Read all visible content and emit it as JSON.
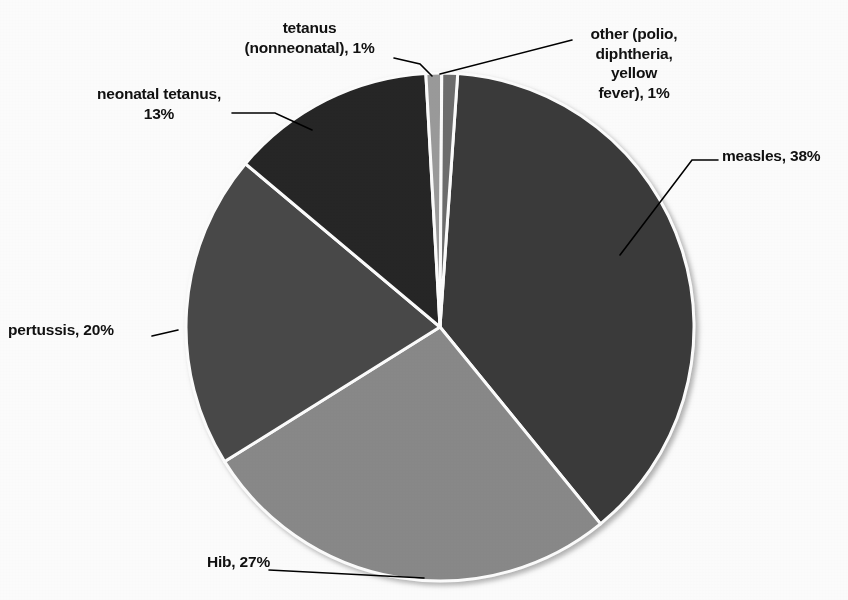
{
  "chart_data": {
    "type": "pie",
    "title": "",
    "subtitle": "",
    "xlabel": "",
    "ylabel": "",
    "legend_position": "none",
    "grid": false,
    "labels_inline": true,
    "units": "percent",
    "categories": [
      "measles",
      "Hib",
      "pertussis",
      "neonatal tetanus",
      "tetanus (nonneonatal)",
      "other (polio, diphtheria, yellow fever)"
    ],
    "values": [
      38,
      27,
      20,
      13,
      1,
      1
    ],
    "slices": [
      {
        "key": "measles",
        "name": "measles",
        "value": 38,
        "value_text": "38%",
        "label_text": "measles, 38%",
        "color": "#3a3a3a",
        "start_angle": 4,
        "end_angle": 140.8,
        "label_x": 722,
        "label_y": 146,
        "label_align": "lbl-right",
        "leader": "M 620 255 L 692 160 L 718 160"
      },
      {
        "key": "hib",
        "name": "Hib",
        "value": 27,
        "value_text": "27%",
        "label_text": "Hib, 27%",
        "color": "#8a8a8a",
        "start_angle": 140.8,
        "end_angle": 238,
        "label_x": 262,
        "label_y": 552,
        "label_align": "lbl-left",
        "leader": "M 269 570 L 424 578"
      },
      {
        "key": "pertussis",
        "name": "pertussis",
        "value": 20,
        "value_text": "20%",
        "label_text": "pertussis, 20%",
        "color": "#4a4a4a",
        "start_angle": 238,
        "end_angle": 310,
        "label_x": 12,
        "label_y": 322,
        "label_align": "lbl-right",
        "leader": "M 152 336 L 178 330"
      },
      {
        "key": "neonatal-tetanus",
        "name": "neonatal tetanus",
        "value": 13,
        "value_text": "13%",
        "label_text": "neonatal tetanus,\n13%",
        "color": "#262626",
        "start_angle": 310,
        "end_angle": 356.8,
        "label_x": 88,
        "label_y": 84,
        "label_align": "lbl-center",
        "leader": "M 232 113 L 275 113 L 312 130"
      },
      {
        "key": "tetanus-nonneonatal",
        "name": "tetanus (nonneonatal)",
        "value": 1,
        "value_text": "1%",
        "label_text": "tetanus\n(nonneonatal), 1%",
        "color": "#9c9c9c",
        "start_angle": 356.8,
        "end_angle": 360.4,
        "label_x": 226,
        "label_y": 18,
        "label_align": "lbl-center",
        "leader": "M 394 58 L 420 64 L 432 76"
      },
      {
        "key": "other",
        "name": "other (polio, diphtheria, yellow fever)",
        "value": 1,
        "value_text": "1%",
        "label_text": "other (polio,\ndiphtheria,\nyellow\nfever), 1%",
        "color": "#6e6e6e",
        "start_angle": 0.4,
        "end_angle": 4,
        "label_x": 578,
        "label_y": 24,
        "label_align": "lbl-center",
        "leader": "M 440 74 L 572 40"
      }
    ],
    "geometry": {
      "center_x": 440,
      "center_y": 327,
      "radius": 254,
      "start_offset_deg": 0,
      "separator_color": "#ffffff",
      "separator_width": 3
    },
    "style": {
      "background": "#ffffff",
      "text_color": "#111111",
      "leader_color": "#000000"
    }
  }
}
